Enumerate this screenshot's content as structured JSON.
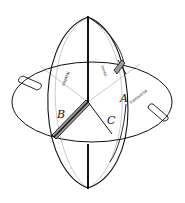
{
  "diagram": {
    "planes": [
      {
        "id": "A",
        "label": "A",
        "caption": "transverse"
      },
      {
        "id": "B",
        "label": "B",
        "caption": "sagittal"
      },
      {
        "id": "C",
        "label": "C",
        "caption": "frontal"
      }
    ],
    "axis_marker_label": "B",
    "colors": {
      "stroke": "#111111",
      "hidden_stroke": "#bbbbbb",
      "shade": "#9a9a9a",
      "background": "#ffffff"
    }
  }
}
